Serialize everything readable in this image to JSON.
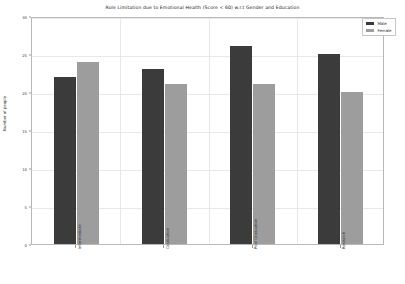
{
  "chart_data": {
    "type": "bar",
    "title": "Role Limitation due to Emotional Health (Score < 60) w.r.t Gender and Education",
    "xlabel": "",
    "ylabel": "Number of people",
    "categories": [
      "Intermediate",
      "Graduation",
      "Post Graduation",
      "Research"
    ],
    "series": [
      {
        "name": "Male",
        "values": [
          22,
          23,
          26,
          25
        ],
        "color": "#3b3b3b"
      },
      {
        "name": "Female",
        "values": [
          24,
          21,
          21,
          20
        ],
        "color": "#9d9d9d"
      }
    ],
    "ylim": [
      0,
      30
    ],
    "yticks": [
      0,
      5,
      10,
      15,
      20,
      25,
      30
    ],
    "ytick_labels": [
      "0",
      "5",
      "10",
      "15",
      "20",
      "25",
      "30"
    ],
    "grid": true,
    "legend_position": "upper right"
  },
  "legend": {
    "entries": [
      {
        "label": "Male",
        "swatch": "male-swatch"
      },
      {
        "label": "Female",
        "swatch": "female-swatch"
      }
    ]
  }
}
